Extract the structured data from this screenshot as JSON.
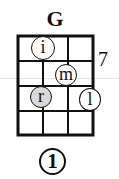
{
  "chord": {
    "name": "G",
    "fret_position": "7",
    "position_marker": "1",
    "strings": 4,
    "frets_shown": 4,
    "fingers": [
      {
        "label": "i",
        "string": 2,
        "fret": 1,
        "shaded": false
      },
      {
        "label": "m",
        "string": 3,
        "fret": 2,
        "shaded": false
      },
      {
        "label": "r",
        "string": 2,
        "fret": 3,
        "shaded": true
      },
      {
        "label": "l",
        "string": 4,
        "fret": 3,
        "shaded": false
      }
    ]
  },
  "colors": {
    "line": "#111111",
    "background": "#ffffff",
    "shaded_dot": "#d9d9d9"
  }
}
